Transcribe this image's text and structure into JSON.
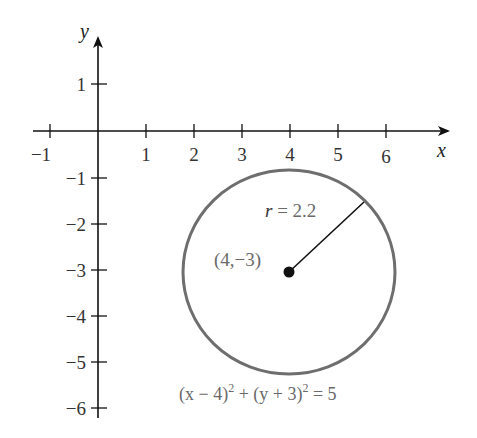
{
  "figure": {
    "axes": {
      "x_label": "x",
      "y_label": "y",
      "x_ticks": [
        {
          "value": -1,
          "label": "−1"
        },
        {
          "value": 1,
          "label": "1"
        },
        {
          "value": 2,
          "label": "2"
        },
        {
          "value": 3,
          "label": "3"
        },
        {
          "value": 4,
          "label": "4"
        },
        {
          "value": 5,
          "label": "5"
        },
        {
          "value": 6,
          "label": "6"
        }
      ],
      "y_ticks": [
        {
          "value": 1,
          "label": "1"
        },
        {
          "value": -1,
          "label": "−1"
        },
        {
          "value": -2,
          "label": "−2"
        },
        {
          "value": -3,
          "label": "−3"
        },
        {
          "value": -4,
          "label": "−4"
        },
        {
          "value": -5,
          "label": "−5"
        },
        {
          "value": -6,
          "label": "−6"
        }
      ]
    },
    "circle": {
      "center_label": "(4,−3)",
      "radius_var": "r",
      "radius_text": " = 2.2",
      "stroke_color": "#6e6e6e"
    },
    "equation": {
      "part1": "(x − 4)",
      "sup1": "2",
      "part2": " + (y + 3)",
      "sup2": "2",
      "part3": " = 5"
    }
  }
}
